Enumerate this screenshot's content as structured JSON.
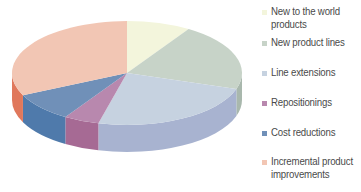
{
  "chart_data": {
    "type": "pie",
    "style": "3d",
    "title": "",
    "categories": [
      "New to the world products",
      "New product lines",
      "Line extensions",
      "Repositionings",
      "Cost reductions",
      "Incremental product improvements"
    ],
    "values": [
      9,
      21,
      24,
      5,
      9,
      32
    ],
    "unit": "%",
    "legend_position": "right",
    "colors": {
      "top": [
        "#f3f5dc",
        "#c7d3c8",
        "#c6d2e0",
        "#b888ae",
        "#7090b8",
        "#f2c6b4"
      ],
      "side": [
        "#e0e2c4",
        "#a9b8ad",
        "#a8b3d0",
        "#a66a94",
        "#4f7aab",
        "#e0785c"
      ]
    }
  },
  "legend": {
    "items": [
      {
        "label": "New to the world products",
        "color": "#f3f5dc",
        "top": 5
      },
      {
        "label": "New product lines",
        "color": "#c7d3c8",
        "top": 36
      },
      {
        "label": "Line extensions",
        "color": "#c6d2e0",
        "top": 66
      },
      {
        "label": "Repositionings",
        "color": "#b888ae",
        "top": 96
      },
      {
        "label": "Cost reductions",
        "color": "#7090b8",
        "top": 126
      },
      {
        "label": "Incremental product improvements",
        "color": "#f2c6b4",
        "top": 155
      }
    ]
  }
}
